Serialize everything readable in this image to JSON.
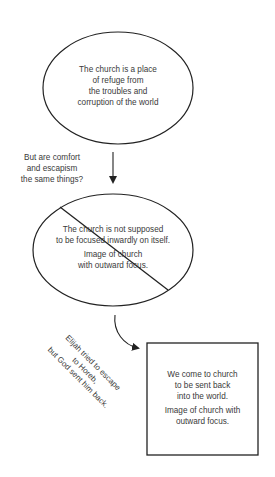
{
  "diagram": {
    "node1": {
      "shape": "ellipse",
      "lines": [
        "The church is a place",
        "of refuge from",
        "the troubles and",
        "corruption of the world"
      ]
    },
    "side_question": {
      "lines": [
        "But are comfort",
        "and escapism",
        "the same things?"
      ]
    },
    "node2": {
      "shape": "ellipse-crossed-out",
      "statement_lines": [
        "The church is not supposed",
        "to be focused inwardly on itself."
      ],
      "caption_lines": [
        "Image of church",
        "with outward focus."
      ]
    },
    "side_note": {
      "lines": [
        "Elijah tried to escape",
        "to Horeb,",
        "but God sent him back."
      ]
    },
    "node3": {
      "shape": "rectangle",
      "statement_lines": [
        "We come to church",
        "to be sent back",
        "into the world."
      ],
      "caption_lines": [
        "Image of church with",
        "outward focus."
      ]
    },
    "colors": {
      "stroke": "#222222",
      "text": "#3a3a3a",
      "background": "#ffffff"
    }
  }
}
